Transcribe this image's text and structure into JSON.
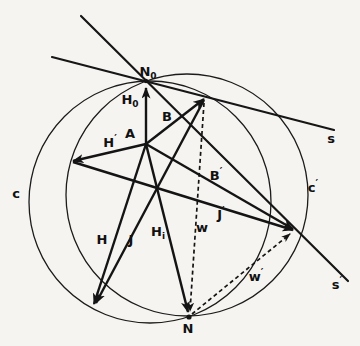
{
  "figure": {
    "width": 360,
    "height": 346,
    "background_color": "#f5f4f1",
    "ink_color": "#141414",
    "circles": [
      {
        "name": "circle-c",
        "cx": 150,
        "cy": 202,
        "r": 121
      },
      {
        "name": "circle-c-prime",
        "cx": 187,
        "cy": 195,
        "r": 121
      }
    ],
    "tangent_lines": [
      {
        "name": "line-s",
        "x1": 52,
        "y1": 57,
        "x2": 334,
        "y2": 130
      },
      {
        "name": "line-s-prime",
        "x1": 81,
        "y1": 16,
        "x2": 348,
        "y2": 281
      }
    ],
    "vectors": [
      {
        "name": "vector-h0",
        "x1": 146,
        "y1": 144,
        "x2": 146,
        "y2": 88,
        "dashed": false
      },
      {
        "name": "vector-b",
        "x1": 146,
        "y1": 144,
        "x2": 204,
        "y2": 99,
        "dashed": false
      },
      {
        "name": "vector-h-prime",
        "x1": 146,
        "y1": 144,
        "x2": 73,
        "y2": 161,
        "dashed": false
      },
      {
        "name": "vector-b-prime",
        "x1": 146,
        "y1": 144,
        "x2": 293,
        "y2": 229,
        "dashed": false
      },
      {
        "name": "vector-h",
        "x1": 146,
        "y1": 144,
        "x2": 94,
        "y2": 304,
        "dashed": false
      },
      {
        "name": "vector-h-i",
        "x1": 146,
        "y1": 144,
        "x2": 188,
        "y2": 312,
        "dashed": false
      },
      {
        "name": "vector-j",
        "x1": 204,
        "y1": 100,
        "x2": 96,
        "y2": 303,
        "dashed": false
      },
      {
        "name": "vector-j-prime",
        "x1": 73,
        "y1": 162,
        "x2": 293,
        "y2": 230,
        "dashed": false
      },
      {
        "name": "vector-w",
        "x1": 204,
        "y1": 103,
        "x2": 190,
        "y2": 311,
        "dashed": true
      },
      {
        "name": "vector-w-prime",
        "x1": 192,
        "y1": 314,
        "x2": 290,
        "y2": 234,
        "dashed": true
      }
    ],
    "points": [
      {
        "name": "point-n0",
        "x": 146,
        "y": 81,
        "r": 2.2
      },
      {
        "name": "point-n",
        "x": 189,
        "y": 317,
        "r": 2.6
      },
      {
        "name": "point-a",
        "x": 146,
        "y": 144,
        "r": 1.6
      }
    ],
    "labels": [
      {
        "name": "label-n0",
        "x": 148,
        "y": 76,
        "main": "N",
        "sub": "0"
      },
      {
        "name": "label-h0",
        "x": 130,
        "y": 104,
        "main": "H",
        "sub": "0"
      },
      {
        "name": "label-a",
        "x": 130,
        "y": 138,
        "main": "A"
      },
      {
        "name": "label-b",
        "x": 167,
        "y": 121,
        "main": "B"
      },
      {
        "name": "label-h-prime",
        "x": 110,
        "y": 147,
        "main": "H",
        "sup": "′"
      },
      {
        "name": "label-b-prime",
        "x": 216,
        "y": 180,
        "main": "B",
        "sup": "′"
      },
      {
        "name": "label-j-prime",
        "x": 221,
        "y": 219,
        "main": "J",
        "sup": "′"
      },
      {
        "name": "label-w",
        "x": 202,
        "y": 232,
        "main": "w"
      },
      {
        "name": "label-w-prime",
        "x": 256,
        "y": 281,
        "main": "w",
        "sup": "′"
      },
      {
        "name": "label-h",
        "x": 102,
        "y": 244,
        "main": "H"
      },
      {
        "name": "label-j",
        "x": 131,
        "y": 244,
        "main": "J"
      },
      {
        "name": "label-h-i",
        "x": 158,
        "y": 236,
        "main": "H",
        "sub": "i"
      },
      {
        "name": "label-n",
        "x": 188,
        "y": 333,
        "main": "N"
      },
      {
        "name": "label-c",
        "x": 16,
        "y": 198,
        "main": "c"
      },
      {
        "name": "label-c-prime",
        "x": 313,
        "y": 192,
        "main": "c",
        "sup": "′"
      },
      {
        "name": "label-s",
        "x": 331,
        "y": 143,
        "main": "s"
      },
      {
        "name": "label-s-prime",
        "x": 337,
        "y": 289,
        "main": "s",
        "sup": "′"
      }
    ]
  }
}
